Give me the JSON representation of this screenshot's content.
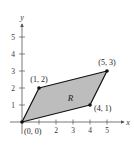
{
  "figure": {
    "type": "coordinate-plane-region",
    "x_axis_label": "x",
    "y_axis_label": "y",
    "x_ticks": [
      1,
      2,
      3,
      4,
      5
    ],
    "x_tick_labels": [
      "",
      "2",
      "3",
      "4",
      "5"
    ],
    "y_ticks": [
      1,
      2,
      3,
      4,
      5
    ],
    "y_tick_labels": [
      "1",
      "2",
      "3",
      "4",
      "5"
    ],
    "x_range": [
      0,
      5.6
    ],
    "y_range": [
      0,
      6
    ],
    "region_label": "R",
    "region_fill": "#bdbdbd",
    "outline_color": "#111111",
    "vertices": [
      {
        "x": 0,
        "y": 0,
        "label": "(0, 0)"
      },
      {
        "x": 4,
        "y": 1,
        "label": "(4, 1)"
      },
      {
        "x": 5,
        "y": 3,
        "label": "(5, 3)"
      },
      {
        "x": 1,
        "y": 2,
        "label": "(1, 2)"
      }
    ]
  }
}
